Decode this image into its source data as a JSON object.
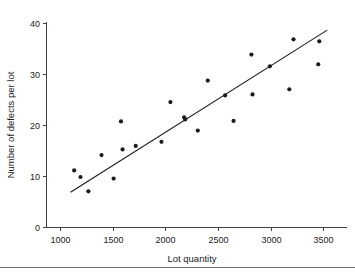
{
  "chart_data": {
    "type": "scatter",
    "title": "",
    "xlabel": "Lot quantity",
    "ylabel": "Number of defects per lot",
    "xlim": [
      900,
      3620
    ],
    "ylim": [
      0,
      43
    ],
    "xticks": [
      1000,
      1500,
      2000,
      2500,
      3000,
      3500
    ],
    "yticks": [
      0,
      10,
      20,
      30,
      40
    ],
    "grid": false,
    "legend": null,
    "series": [
      {
        "name": "Observations",
        "marker": "filled-circle",
        "color": "#1c1c1c",
        "points": [
          {
            "x": 1130,
            "y": 11.2
          },
          {
            "x": 1190,
            "y": 9.9
          },
          {
            "x": 1265,
            "y": 7.1
          },
          {
            "x": 1390,
            "y": 14.2
          },
          {
            "x": 1505,
            "y": 9.6
          },
          {
            "x": 1575,
            "y": 20.8
          },
          {
            "x": 1590,
            "y": 15.3
          },
          {
            "x": 1715,
            "y": 16.0
          },
          {
            "x": 1960,
            "y": 16.8
          },
          {
            "x": 2045,
            "y": 24.6
          },
          {
            "x": 2175,
            "y": 21.6
          },
          {
            "x": 2185,
            "y": 21.2
          },
          {
            "x": 2305,
            "y": 19.0
          },
          {
            "x": 2400,
            "y": 28.8
          },
          {
            "x": 2565,
            "y": 25.9
          },
          {
            "x": 2645,
            "y": 20.9
          },
          {
            "x": 2815,
            "y": 33.9
          },
          {
            "x": 2825,
            "y": 26.1
          },
          {
            "x": 2990,
            "y": 31.6
          },
          {
            "x": 3175,
            "y": 27.1
          },
          {
            "x": 3215,
            "y": 36.9
          },
          {
            "x": 3450,
            "y": 32.0
          },
          {
            "x": 3460,
            "y": 36.5
          }
        ]
      }
    ],
    "trendline": {
      "name": "Least-squares fit",
      "type": "line",
      "color": "#1c1c1c",
      "x_start": 1095,
      "y_start": 6.9,
      "x_end": 3535,
      "y_end": 38.7
    }
  },
  "axes": {
    "x": {
      "label": "Lot quantity",
      "tick_labels": [
        "1000",
        "1500",
        "2000",
        "2500",
        "3000",
        "3500"
      ]
    },
    "y": {
      "label": "Number of defects per lot",
      "tick_labels": [
        "0",
        "10",
        "20",
        "30",
        "40"
      ]
    }
  }
}
